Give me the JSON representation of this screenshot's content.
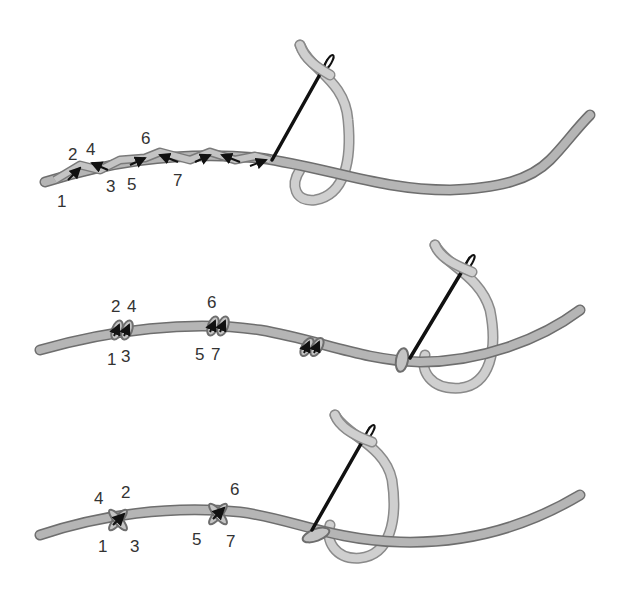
{
  "colors": {
    "background": "#ffffff",
    "cord_fill": "#b5b5b5",
    "cord_outline": "#6e6e6e",
    "thread_fill": "#cfcfcf",
    "thread_outline": "#8a8a8a",
    "needle": "#111111",
    "label": "#333333"
  },
  "panels": [
    {
      "id": "panel-1",
      "description": "Continuous overlapping stitches along cord",
      "labels": [
        {
          "text": "1",
          "x": 57,
          "y": 207
        },
        {
          "text": "2",
          "x": 68,
          "y": 160
        },
        {
          "text": "4",
          "x": 86,
          "y": 155
        },
        {
          "text": "3",
          "x": 106,
          "y": 192
        },
        {
          "text": "5",
          "x": 127,
          "y": 190
        },
        {
          "text": "6",
          "x": 141,
          "y": 144
        },
        {
          "text": "7",
          "x": 173,
          "y": 186
        }
      ]
    },
    {
      "id": "panel-2",
      "description": "Grouped pairs of stitches along cord",
      "labels": [
        {
          "text": "2",
          "x": 111,
          "y": 312
        },
        {
          "text": "4",
          "x": 127,
          "y": 312
        },
        {
          "text": "1",
          "x": 107,
          "y": 365
        },
        {
          "text": "3",
          "x": 121,
          "y": 362
        },
        {
          "text": "6",
          "x": 207,
          "y": 308
        },
        {
          "text": "5",
          "x": 195,
          "y": 360
        },
        {
          "text": "7",
          "x": 211,
          "y": 360
        }
      ]
    },
    {
      "id": "panel-3",
      "description": "Cross stitches spaced along cord",
      "labels": [
        {
          "text": "4",
          "x": 94,
          "y": 504
        },
        {
          "text": "2",
          "x": 121,
          "y": 498
        },
        {
          "text": "1",
          "x": 98,
          "y": 552
        },
        {
          "text": "3",
          "x": 130,
          "y": 552
        },
        {
          "text": "6",
          "x": 230,
          "y": 495
        },
        {
          "text": "5",
          "x": 192,
          "y": 545
        },
        {
          "text": "7",
          "x": 226,
          "y": 547
        }
      ]
    }
  ]
}
